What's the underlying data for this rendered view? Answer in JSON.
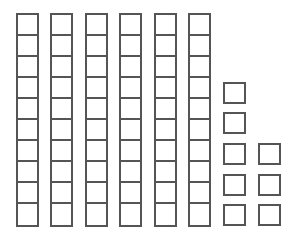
{
  "diagram": {
    "type": "base-ten-blocks",
    "stroke_color": "#555555",
    "background": "#ffffff",
    "tens_rods": {
      "count": 6,
      "cells_per_rod": 10,
      "x_positions": [
        16,
        50,
        85,
        119,
        154,
        188
      ],
      "top": 13,
      "height": 214
    },
    "unit_cubes": {
      "count": 8,
      "items": [
        {
          "x": 223,
          "y": 82
        },
        {
          "x": 223,
          "y": 112
        },
        {
          "x": 223,
          "y": 143
        },
        {
          "x": 223,
          "y": 174
        },
        {
          "x": 223,
          "y": 204
        },
        {
          "x": 258,
          "y": 143
        },
        {
          "x": 258,
          "y": 174
        },
        {
          "x": 258,
          "y": 204
        }
      ]
    },
    "represented_value": 68
  }
}
